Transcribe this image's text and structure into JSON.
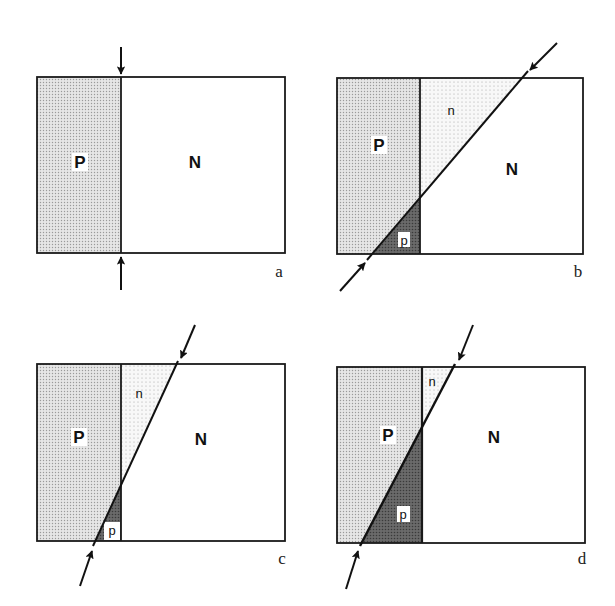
{
  "figure": {
    "panels": [
      {
        "id": "a",
        "label": "a",
        "regions": {
          "P": "P",
          "N": "N"
        },
        "rect": {
          "x1": 37,
          "y1": 77,
          "x2": 285,
          "y2": 253
        },
        "junction_x": 121,
        "cut": "vertical",
        "arrows": [
          {
            "from": [
              121,
              47
            ],
            "to": [
              121,
              74
            ]
          },
          {
            "from": [
              121,
              290
            ],
            "to": [
              121,
              257
            ]
          }
        ]
      },
      {
        "id": "b",
        "label": "b",
        "regions": {
          "P": "P",
          "N": "N",
          "n": "n",
          "p": "p"
        },
        "rect": {
          "x1": 337,
          "y1": 78,
          "x2": 583,
          "y2": 254
        },
        "junction_x": 420,
        "cut_line": {
          "from": [
            367,
            260
          ],
          "to": [
            528,
            71
          ]
        },
        "arrows": [
          {
            "from": [
              557,
              43
            ],
            "to": [
              530,
              70
            ]
          },
          {
            "from": [
              340,
              291
            ],
            "to": [
              365,
              263
            ]
          }
        ]
      },
      {
        "id": "c",
        "label": "c",
        "regions": {
          "P": "P",
          "N": "N",
          "n": "n",
          "p": "p"
        },
        "rect": {
          "x1": 37,
          "y1": 364,
          "x2": 285,
          "y2": 541
        },
        "junction_x": 121,
        "cut_line": {
          "from": [
            93,
            546
          ],
          "to": [
            178,
            361
          ]
        },
        "arrows": [
          {
            "from": [
              195,
              325
            ],
            "to": [
              181,
              358
            ]
          },
          {
            "from": [
              80,
              586
            ],
            "to": [
              92,
              551
            ]
          }
        ]
      },
      {
        "id": "d",
        "label": "d",
        "regions": {
          "P": "P",
          "N": "N",
          "n": "n",
          "p": "p"
        },
        "rect": {
          "x1": 337,
          "y1": 367,
          "x2": 585,
          "y2": 543
        },
        "junction_x": 422,
        "cut_line": {
          "from": [
            360,
            546
          ],
          "to": [
            455,
            364
          ]
        },
        "arrows": [
          {
            "from": [
              473,
              325
            ],
            "to": [
              459,
              360
            ]
          },
          {
            "from": [
              346,
              589
            ],
            "to": [
              358,
              551
            ]
          }
        ]
      }
    ],
    "colors": {
      "p_region": "#dcdcdc",
      "n_dotted_region": "#f2f2f2",
      "p_dark_region": "#6e6e6e",
      "outline": "#1a1a1a",
      "background": "#ffffff"
    }
  }
}
